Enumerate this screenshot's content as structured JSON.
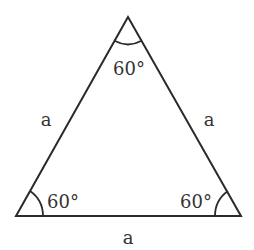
{
  "diagram": {
    "type": "equilateral-triangle",
    "stroke_color": "#2a2a2a",
    "label_color": "#333333",
    "vertices": {
      "top": [
        128,
        17
      ],
      "bottom_left": [
        16,
        216
      ],
      "bottom_right": [
        241,
        216
      ]
    },
    "sides": {
      "left": "a",
      "right": "a",
      "bottom": "a"
    },
    "angles": {
      "top": "60°",
      "bottom_left": "60°",
      "bottom_right": "60°"
    }
  }
}
